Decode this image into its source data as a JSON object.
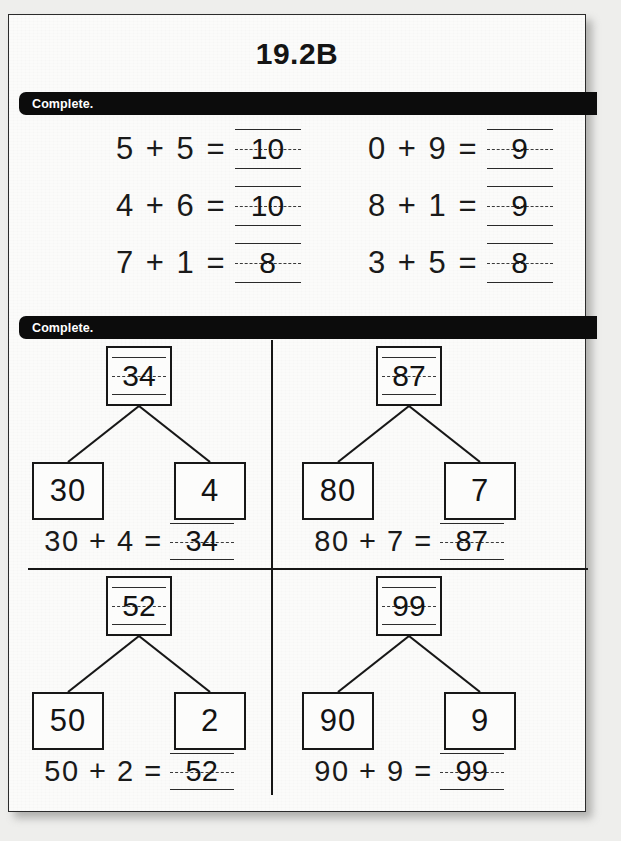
{
  "worksheet": {
    "title": "19.2B",
    "section_1": {
      "direction": "Complete.",
      "rows": [
        {
          "left": {
            "problem": "5 + 5 =",
            "answer": "10"
          },
          "right": {
            "problem": "0 + 9 =",
            "answer": "9"
          }
        },
        {
          "left": {
            "problem": "4 + 6 =",
            "answer": "10"
          },
          "right": {
            "problem": "8 + 1 =",
            "answer": "9"
          }
        },
        {
          "left": {
            "problem": "7 + 1 =",
            "answer": "8"
          },
          "right": {
            "problem": "3 + 5 =",
            "answer": "8"
          }
        }
      ]
    },
    "section_2": {
      "direction": "Complete.",
      "bonds": [
        {
          "whole": "34",
          "part_left": "30",
          "part_right": "4",
          "sentence": "30 + 4 =",
          "sentence_answer": "34"
        },
        {
          "whole": "87",
          "part_left": "80",
          "part_right": "7",
          "sentence": "80 + 7 =",
          "sentence_answer": "87"
        },
        {
          "whole": "52",
          "part_left": "50",
          "part_right": "2",
          "sentence": "50 + 2 =",
          "sentence_answer": "52"
        },
        {
          "whole": "99",
          "part_left": "90",
          "part_right": "9",
          "sentence": "90 + 9 =",
          "sentence_answer": "99"
        }
      ]
    }
  },
  "colors": {
    "ink": "#141414",
    "banner_bg": "#0c0c0c",
    "banner_text": "#ffffff",
    "paper": "#fbfbfa",
    "backdrop": "#eeeeec"
  }
}
